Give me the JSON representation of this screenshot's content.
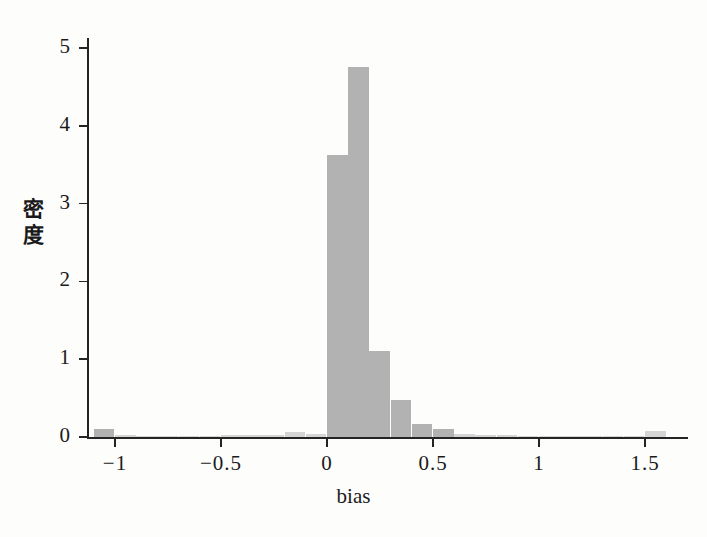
{
  "chart_data": {
    "type": "bar",
    "title": "",
    "subtitle": "",
    "xlabel": "bias",
    "ylabel": "密度",
    "grid": false,
    "legend": "none",
    "bar_color": "#b2b2b2",
    "axis_color": "#242424",
    "background_color": "#fdfdfc",
    "xlim": [
      -1.13,
      1.66
    ],
    "ylim": [
      0,
      5.15
    ],
    "xticks": [
      -1,
      -0.5,
      0,
      0.5,
      1,
      1.5
    ],
    "xtick_labels": [
      "−1",
      "−0.5",
      "0",
      "0.5",
      "1",
      "1.5"
    ],
    "yticks": [
      0,
      1,
      2,
      3,
      4,
      5
    ],
    "ytick_labels": [
      "0",
      "1",
      "2",
      "3",
      "4",
      "5"
    ],
    "bin_width": 0.1,
    "bins": [
      {
        "x0": -1.1,
        "x1": -1.0,
        "value": 0.1
      },
      {
        "x0": -1.0,
        "x1": -0.9,
        "value": 0.02
      },
      {
        "x0": -0.9,
        "x1": -0.8,
        "value": 0.012
      },
      {
        "x0": -0.8,
        "x1": -0.7,
        "value": 0.012
      },
      {
        "x0": -0.7,
        "x1": -0.6,
        "value": 0.018
      },
      {
        "x0": -0.6,
        "x1": -0.5,
        "value": 0.018
      },
      {
        "x0": -0.5,
        "x1": -0.4,
        "value": 0.022
      },
      {
        "x0": -0.4,
        "x1": -0.3,
        "value": 0.026
      },
      {
        "x0": -0.3,
        "x1": -0.2,
        "value": 0.032
      },
      {
        "x0": -0.2,
        "x1": -0.1,
        "value": 0.06
      },
      {
        "x0": -0.1,
        "x1": 0.0,
        "value": 0.035
      },
      {
        "x0": 0.0,
        "x1": 0.1,
        "value": 3.62
      },
      {
        "x0": 0.1,
        "x1": 0.2,
        "value": 4.76
      },
      {
        "x0": 0.2,
        "x1": 0.3,
        "value": 1.1
      },
      {
        "x0": 0.3,
        "x1": 0.4,
        "value": 0.47
      },
      {
        "x0": 0.4,
        "x1": 0.5,
        "value": 0.17
      },
      {
        "x0": 0.5,
        "x1": 0.6,
        "value": 0.1
      },
      {
        "x0": 0.6,
        "x1": 0.7,
        "value": 0.045
      },
      {
        "x0": 0.7,
        "x1": 0.8,
        "value": 0.03
      },
      {
        "x0": 0.8,
        "x1": 0.9,
        "value": 0.02
      },
      {
        "x0": 0.9,
        "x1": 1.0,
        "value": 0.014
      },
      {
        "x0": 1.0,
        "x1": 1.1,
        "value": 0.012
      },
      {
        "x0": 1.1,
        "x1": 1.2,
        "value": 0.01
      },
      {
        "x0": 1.2,
        "x1": 1.3,
        "value": 0.01
      },
      {
        "x0": 1.3,
        "x1": 1.4,
        "value": 0.01
      },
      {
        "x0": 1.4,
        "x1": 1.5,
        "value": 0.008
      },
      {
        "x0": 1.5,
        "x1": 1.6,
        "value": 0.075
      }
    ]
  }
}
